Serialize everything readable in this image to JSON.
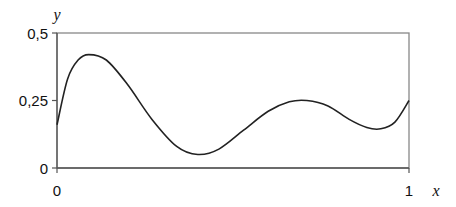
{
  "chart_data": {
    "type": "line",
    "title": "",
    "xlabel": "x",
    "ylabel": "y",
    "xlim": [
      0,
      1
    ],
    "ylim": [
      0,
      0.5
    ],
    "x_ticks": [
      "0",
      "1"
    ],
    "y_ticks": [
      "0",
      "0,25",
      "0,5"
    ],
    "grid": false,
    "legend": null,
    "series": [
      {
        "name": "y(x)",
        "x": [
          0,
          0.03,
          0.06,
          0.09,
          0.14,
          0.2,
          0.27,
          0.34,
          0.4,
          0.46,
          0.53,
          0.6,
          0.66,
          0.71,
          0.77,
          0.83,
          0.88,
          0.92,
          0.96,
          1.0
        ],
        "values": [
          0.16,
          0.33,
          0.4,
          0.42,
          0.4,
          0.31,
          0.18,
          0.08,
          0.05,
          0.07,
          0.14,
          0.21,
          0.245,
          0.25,
          0.23,
          0.18,
          0.15,
          0.145,
          0.17,
          0.25
        ]
      }
    ]
  },
  "labels": {
    "x_axis_var": "x",
    "y_axis_var": "y",
    "x_tick_0": "0",
    "x_tick_1": "1",
    "y_tick_0": "0",
    "y_tick_025": "0,25",
    "y_tick_05": "0,5"
  }
}
